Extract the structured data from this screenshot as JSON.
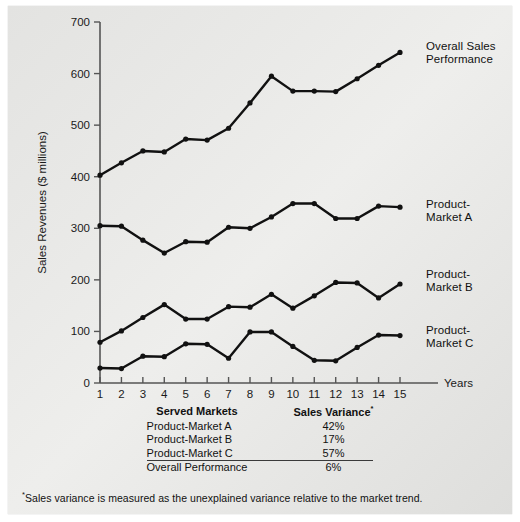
{
  "chart_data": {
    "type": "line",
    "title": "",
    "xlabel": "Years",
    "ylabel": "Sales Revenues ($ millions)",
    "x": [
      1,
      2,
      3,
      4,
      5,
      6,
      7,
      8,
      9,
      10,
      11,
      12,
      13,
      14,
      15
    ],
    "xtick_labels": [
      "1",
      "2",
      "3",
      "4",
      "5",
      "6",
      "7",
      "8",
      "9",
      "10",
      "11",
      "12",
      "13",
      "14",
      "15"
    ],
    "ytick_labels": [
      "0",
      "100",
      "200",
      "300",
      "400",
      "500",
      "600",
      "700"
    ],
    "yticks": [
      0,
      100,
      200,
      300,
      400,
      500,
      600,
      700
    ],
    "ylim": [
      0,
      700
    ],
    "xlim": [
      1,
      15
    ],
    "grid": false,
    "legend_position": "right-inline-labels",
    "series": [
      {
        "name": "Overall Sales Performance",
        "label": "Overall Sales\nPerformance",
        "values": [
          403,
          427,
          450,
          448,
          473,
          471,
          494,
          543,
          595,
          566,
          566,
          565,
          590,
          616,
          641
        ]
      },
      {
        "name": "Product-Market A",
        "label": "Product-\nMarket A",
        "values": [
          305,
          304,
          277,
          252,
          274,
          273,
          302,
          300,
          322,
          348,
          348,
          319,
          319,
          343,
          341
        ]
      },
      {
        "name": "Product-Market B",
        "label": "Product-\nMarket B",
        "values": [
          79,
          101,
          127,
          152,
          124,
          124,
          148,
          147,
          172,
          145,
          169,
          195,
          194,
          165,
          192
        ]
      },
      {
        "name": "Product-Market C",
        "label": "Product-\nMarket C",
        "values": [
          29,
          28,
          52,
          51,
          76,
          75,
          48,
          99,
          99,
          71,
          44,
          43,
          69,
          93,
          92
        ]
      }
    ]
  },
  "table": {
    "headers": {
      "markets": "Served Markets",
      "variance": "Sales Variance",
      "variance_sup": "*"
    },
    "rows": [
      {
        "market": "Product-Market A",
        "variance": "42%"
      },
      {
        "market": "Product-Market B",
        "variance": "17%"
      },
      {
        "market": "Product-Market C",
        "variance": "57%"
      }
    ],
    "total": {
      "market": "Overall Performance",
      "variance": "6%"
    }
  },
  "footnote": {
    "marker": "*",
    "text": "Sales variance is measured as the unexplained variance relative to the market trend."
  }
}
